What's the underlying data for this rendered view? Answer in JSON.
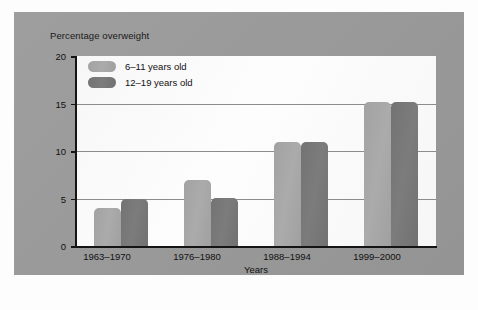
{
  "chart_data": {
    "type": "bar",
    "title": "",
    "xlabel": "Years",
    "ylabel": "Percentage overweight",
    "ylim": [
      0,
      20
    ],
    "yticks": [
      "0",
      "5",
      "10",
      "15",
      "20"
    ],
    "grid": true,
    "legend_position": "top-left-inside",
    "categories": [
      "1963–1970",
      "1976–1980",
      "1988–1994",
      "1999–2000"
    ],
    "series": [
      {
        "name": "6–11 years old",
        "color": "#a6a6a6",
        "values": [
          4,
          7,
          11,
          15.2
        ]
      },
      {
        "name": "12–19 years old",
        "color": "#767676",
        "values": [
          5,
          5.1,
          11,
          15.2
        ]
      }
    ]
  },
  "figure": {
    "panel_color": "#9a9a9a",
    "plot_background": "#fbfbfb",
    "axis_color": "#141414",
    "gridline_color": "#8c8c8c"
  }
}
